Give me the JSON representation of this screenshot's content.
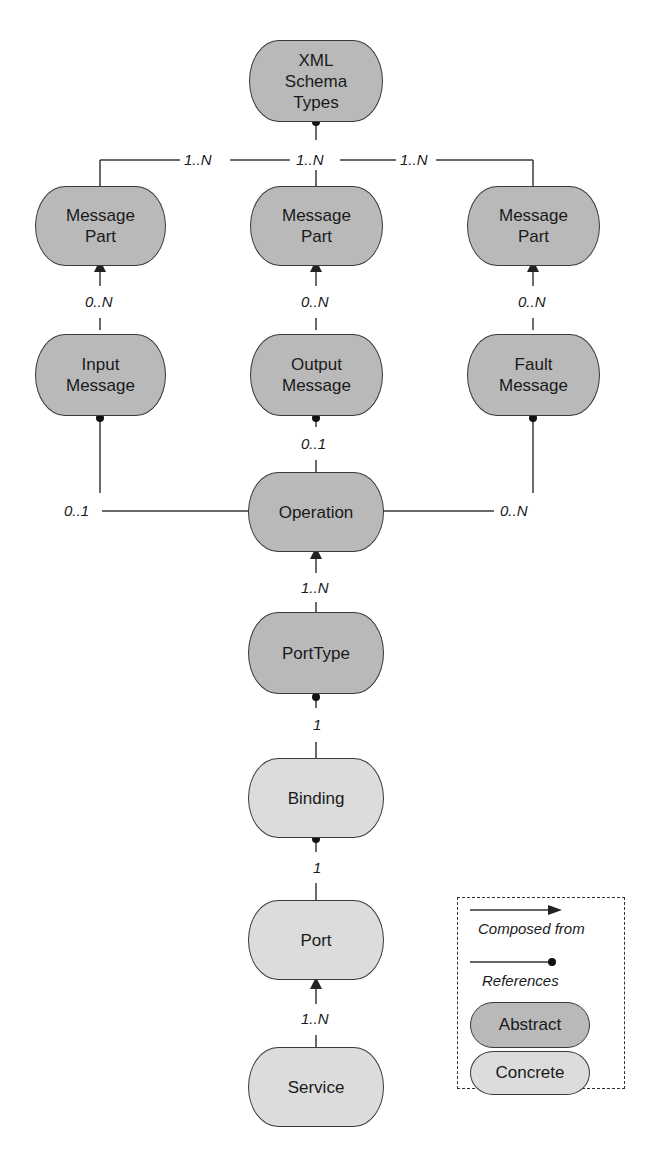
{
  "nodes": {
    "xml_schema_types": {
      "label": "XML\nSchema\nTypes",
      "lines": [
        "XML",
        "Schema",
        "Types"
      ],
      "kind": "abstract"
    },
    "message_part_1": {
      "lines": [
        "Message",
        "Part"
      ],
      "kind": "abstract"
    },
    "message_part_2": {
      "lines": [
        "Message",
        "Part"
      ],
      "kind": "abstract"
    },
    "message_part_3": {
      "lines": [
        "Message",
        "Part"
      ],
      "kind": "abstract"
    },
    "input_message": {
      "lines": [
        "Input",
        "Message"
      ],
      "kind": "abstract"
    },
    "output_message": {
      "lines": [
        "Output",
        "Message"
      ],
      "kind": "abstract"
    },
    "fault_message": {
      "lines": [
        "Fault",
        "Message"
      ],
      "kind": "abstract"
    },
    "operation": {
      "lines": [
        "Operation"
      ],
      "kind": "abstract"
    },
    "porttype": {
      "lines": [
        "PortType"
      ],
      "kind": "abstract"
    },
    "binding": {
      "lines": [
        "Binding"
      ],
      "kind": "concrete"
    },
    "port": {
      "lines": [
        "Port"
      ],
      "kind": "concrete"
    },
    "service": {
      "lines": [
        "Service"
      ],
      "kind": "concrete"
    }
  },
  "edges": [
    {
      "from": "message_part_1",
      "to": "xml_schema_types",
      "type": "references",
      "cardinality": "1..N"
    },
    {
      "from": "message_part_2",
      "to": "xml_schema_types",
      "type": "references",
      "cardinality": "1..N"
    },
    {
      "from": "message_part_3",
      "to": "xml_schema_types",
      "type": "references",
      "cardinality": "1..N"
    },
    {
      "from": "input_message",
      "to": "message_part_1",
      "type": "composed_from",
      "cardinality": "0..N"
    },
    {
      "from": "output_message",
      "to": "message_part_2",
      "type": "composed_from",
      "cardinality": "0..N"
    },
    {
      "from": "fault_message",
      "to": "message_part_3",
      "type": "composed_from",
      "cardinality": "0..N"
    },
    {
      "from": "operation",
      "to": "input_message",
      "type": "references",
      "cardinality": "0..1"
    },
    {
      "from": "operation",
      "to": "output_message",
      "type": "references",
      "cardinality": "0..1"
    },
    {
      "from": "operation",
      "to": "fault_message",
      "type": "references",
      "cardinality": "0..N"
    },
    {
      "from": "porttype",
      "to": "operation",
      "type": "composed_from",
      "cardinality": "1..N"
    },
    {
      "from": "binding",
      "to": "porttype",
      "type": "references",
      "cardinality": "1"
    },
    {
      "from": "port",
      "to": "binding",
      "type": "references",
      "cardinality": "1"
    },
    {
      "from": "service",
      "to": "port",
      "type": "composed_from",
      "cardinality": "1..N"
    }
  ],
  "cards": {
    "c1": "1..N",
    "c2": "1..N",
    "c3": "1..N",
    "c4": "0..N",
    "c5": "0..N",
    "c6": "0..N",
    "c7": "0..1",
    "c8": "0..1",
    "c9": "0..N",
    "c10": "1..N",
    "c11": "1",
    "c12": "1",
    "c13": "1..N"
  },
  "legend": {
    "composed_from": "Composed from",
    "references": "References",
    "abstract": "Abstract",
    "concrete": "Concrete"
  },
  "colors": {
    "abstract": "#b9b9b9",
    "concrete": "#dcdcdc",
    "line": "#3a3a3a"
  }
}
